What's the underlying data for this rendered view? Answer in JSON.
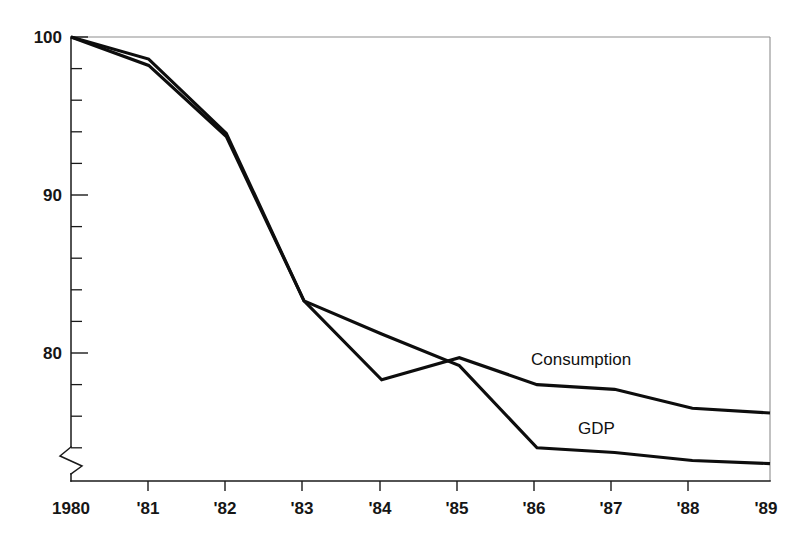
{
  "chart_data": {
    "type": "line",
    "title": "",
    "subtitle": "",
    "xlabel": "",
    "ylabel": "",
    "x": [
      1980,
      1981,
      1982,
      1983,
      1984,
      1985,
      1986,
      1987,
      1988,
      1989
    ],
    "categories": [
      "1980",
      "'81",
      "'82",
      "'83",
      "'84",
      "'85",
      "'86",
      "'87",
      "'88",
      "'89"
    ],
    "series": [
      {
        "name": "Consumption",
        "values": [
          100.0,
          98.6,
          93.9,
          83.3,
          78.3,
          79.7,
          78.0,
          77.7,
          76.5,
          76.2
        ]
      },
      {
        "name": "GDP",
        "values": [
          100.0,
          98.2,
          93.7,
          83.3,
          81.2,
          79.2,
          74.0,
          73.7,
          73.2,
          73.0
        ]
      }
    ],
    "ylim": [
      72.2,
      100.0
    ],
    "y_major_ticks": [
      80,
      90,
      100
    ],
    "y_major_tick_labels": [
      "80",
      "90",
      "100"
    ],
    "y_minor_tick_step": 2,
    "y_axis_break": true,
    "grid": false,
    "legend": "inline-labels",
    "legend_position": "inline",
    "line_color": "#0d0d0d",
    "frame_color": "#8e8e8e",
    "background": "#ffffff"
  },
  "axis": {
    "y_labels": [
      "100",
      "90",
      "80"
    ],
    "x_labels": [
      "1980",
      "'81",
      "'82",
      "'83",
      "'84",
      "'85",
      "'86",
      "'87",
      "'88",
      "'89"
    ]
  },
  "annotations": {
    "consumption_label": "Consumption",
    "gdp_label": "GDP"
  }
}
